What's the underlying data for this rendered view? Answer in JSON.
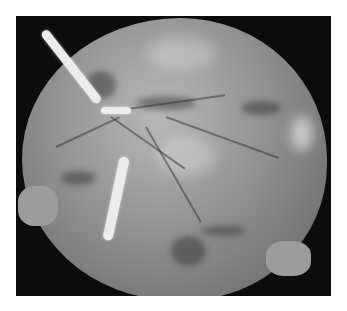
{
  "image": {
    "description": "Grayscale photograph of a placenta (fetal surface) on black background with white umbilical cord segments",
    "background_color": "#ffffff",
    "photo_background": "#0c0c0c",
    "tissue_color": "#9a9a9a",
    "cord_color": "#ececec"
  }
}
